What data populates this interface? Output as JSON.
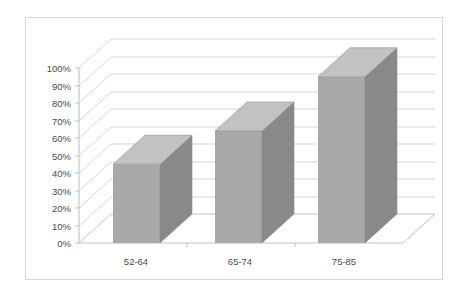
{
  "chart_data": {
    "type": "bar",
    "title": "",
    "subtitle": "",
    "xlabel": "",
    "ylabel": "",
    "categories": [
      "52-64",
      "65-74",
      "75-85"
    ],
    "values": [
      45,
      64,
      95
    ],
    "ylim": [
      0,
      100
    ],
    "y_tick_labels": [
      "0%",
      "10%",
      "20%",
      "30%",
      "40%",
      "50%",
      "60%",
      "70%",
      "80%",
      "90%",
      "100%"
    ],
    "y_ticks": [
      0,
      10,
      20,
      30,
      40,
      50,
      60,
      70,
      80,
      90,
      100
    ],
    "grid": true,
    "legend": "none",
    "style": "3d-column",
    "series": [
      {
        "name": "",
        "values": [
          45,
          64,
          95
        ]
      }
    ],
    "colors": {
      "bar_front": "#a9a9a9",
      "bar_side": "#898989",
      "bar_top": "#c2c2c2",
      "gridline": "#d0d0d0",
      "axis": "#b9b9b9",
      "frame_border": "#d9d9d9",
      "background": "#ffffff",
      "tick_text": "#4a4a4a"
    }
  }
}
